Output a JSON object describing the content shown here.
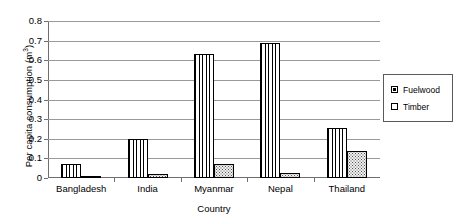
{
  "chart_data": {
    "type": "bar",
    "title": "",
    "xlabel": "Country",
    "ylabel": "Per capita consumption (m3)",
    "ylabel_prefix": "Per capita consumption (m",
    "ylabel_superscript": "3",
    "ylabel_suffix": ")",
    "categories": [
      "Bangladesh",
      "India",
      "Myanmar",
      "Nepal",
      "Thailand"
    ],
    "series": [
      {
        "name": "Fuelwood",
        "pattern": "vertical-stripes",
        "values": [
          0.07,
          0.2,
          0.63,
          0.69,
          0.255
        ]
      },
      {
        "name": "Timber",
        "pattern": "dotted",
        "values": [
          0.012,
          0.022,
          0.07,
          0.025,
          0.14
        ]
      }
    ],
    "ylim": [
      0,
      0.8
    ],
    "ytick_labels": [
      "0",
      "0.1",
      "0.2",
      "0.3",
      "0.4",
      "0.5",
      "0.6",
      "0.7",
      "0.8"
    ],
    "ytick_values": [
      0,
      0.1,
      0.2,
      0.3,
      0.4,
      0.5,
      0.6,
      0.7,
      0.8
    ],
    "grid": true,
    "legend_position": "right",
    "legend_entries": [
      "Fuelwood",
      "Timber"
    ],
    "colors": {
      "axis": "#6e6e6e",
      "grid": "#9a9a9a",
      "bar_outline": "#000000",
      "background": "#ffffff"
    }
  }
}
